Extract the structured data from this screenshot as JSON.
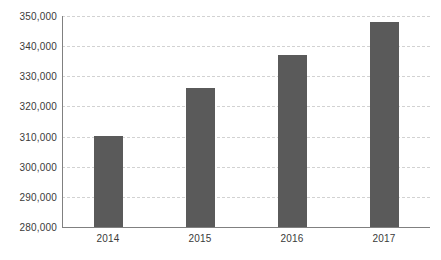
{
  "chart_data": {
    "type": "bar",
    "title": "",
    "xlabel": "",
    "ylabel": "",
    "categories": [
      "2014",
      "2015",
      "2016",
      "2017"
    ],
    "values": [
      310200,
      326100,
      337100,
      348000
    ],
    "ylim": [
      280000,
      350000
    ],
    "ytick_step": 10000,
    "ytick_labels": [
      "280,000",
      "290,000",
      "300,000",
      "310,000",
      "320,000",
      "330,000",
      "340,000",
      "350,000"
    ],
    "ytick_values": [
      280000,
      290000,
      300000,
      310000,
      320000,
      330000,
      340000,
      350000
    ],
    "grid": true,
    "grid_style": "dashed",
    "legend": null,
    "legend_position": "none",
    "series": [
      {
        "name": "Series 1",
        "values": [
          310200,
          326100,
          337100,
          348000
        ]
      }
    ],
    "colors": {
      "bar": "#5a5a5a",
      "gridline": "#d2d2d2",
      "axis": "#808080",
      "text": "#3a3a3a",
      "background": "#ffffff"
    }
  }
}
